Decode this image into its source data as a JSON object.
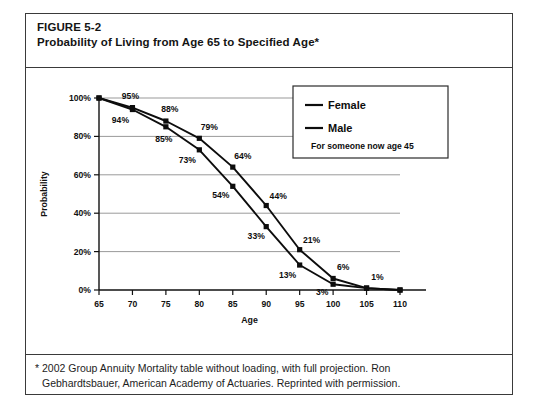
{
  "figure": {
    "label": "FIGURE 5-2",
    "title": "Probability of Living from Age 65 to Specified Age*"
  },
  "footnote": {
    "line1": "* 2002 Group Annuity Mortality table without loading, with full projection. Ron",
    "line2": "Gebhardtsbauer, American Academy of Actuaries. Reprinted with permission."
  },
  "legend": {
    "female_label": "Female",
    "male_label": "Male",
    "note": "For someone now age  45"
  },
  "chart_data": {
    "type": "line",
    "title": "Probability of Living from Age 65 to Specified Age*",
    "xlabel": "Age",
    "ylabel": "Probability",
    "xlim": [
      65,
      110
    ],
    "ylim": [
      0,
      100
    ],
    "xticks": [
      65,
      70,
      75,
      80,
      85,
      90,
      95,
      100,
      105,
      110
    ],
    "yticks": [
      0,
      20,
      40,
      60,
      80,
      100
    ],
    "xticklabels": [
      "65",
      "70",
      "75",
      "80",
      "85",
      "90",
      "95",
      "100",
      "105",
      "110"
    ],
    "yticklabels": [
      "0%",
      "20%",
      "40%",
      "60%",
      "80%",
      "100%"
    ],
    "grid": "horizontal",
    "legend_position": "upper-right",
    "marker": "square",
    "x": [
      65,
      70,
      75,
      80,
      85,
      90,
      95,
      100,
      105,
      110
    ],
    "series": [
      {
        "name": "Female",
        "values": [
          100,
          95,
          88,
          79,
          64,
          44,
          21,
          6,
          1,
          0
        ],
        "labels": [
          "",
          "95%",
          "88%",
          "79%",
          "64%",
          "44%",
          "21%",
          "6%",
          "1%",
          ""
        ]
      },
      {
        "name": "Male",
        "values": [
          100,
          94,
          85,
          73,
          54,
          33,
          13,
          3,
          1,
          0
        ],
        "labels": [
          "",
          "94%",
          "85%",
          "73%",
          "54%",
          "33%",
          "13%",
          "3%",
          "",
          ""
        ]
      }
    ]
  }
}
